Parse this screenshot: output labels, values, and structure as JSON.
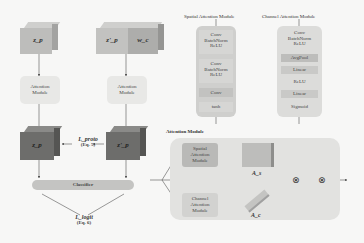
{
  "left_pipeline": {
    "input_a": {
      "label": "z_p"
    },
    "input_b": {
      "label": "z'_p",
      "label2": "w_c"
    },
    "attention_a": {
      "label": "Attention Module"
    },
    "attention_b": {
      "label": "Attention Module"
    },
    "output_a": {
      "label": "z_p"
    },
    "output_b": {
      "label": "z'_p"
    },
    "proto_loss": {
      "label": "L_proto",
      "eq": "(Eq. 5)"
    },
    "classifier": {
      "label": "Classifier"
    },
    "logit_loss": {
      "label": "L_logit",
      "eq": "(Eq. 6)"
    }
  },
  "spatial_module": {
    "title": "Spatial Attention Module",
    "blocks": [
      [
        "Conv",
        "BatchNorm",
        "ReLU"
      ],
      [
        "Conv",
        "BatchNorm",
        "ReLU"
      ],
      [
        "Conv"
      ],
      [
        "tanh"
      ]
    ]
  },
  "channel_module": {
    "title": "Channel Attention Module",
    "blocks": [
      [
        "Conv",
        "BatchNorm",
        "ReLU"
      ],
      [
        "AvgPool"
      ],
      [
        "Linear"
      ],
      [
        "ReLU"
      ],
      [
        "Linear"
      ],
      [
        "Sigmoid"
      ]
    ]
  },
  "attention_module": {
    "title": "Attention Module",
    "spatial_label": "Spatial Attention Module",
    "channel_label": "Channel Attention Module",
    "spatial_map": "A_s",
    "channel_map": "A_c",
    "multiply_symbol": "⊗"
  },
  "colors": {
    "light_cube": "#bdbdbb",
    "dark_cube": "#6d6d6b",
    "panel_bg": "#e4e4e2",
    "module_box": "#b9b9b7"
  }
}
